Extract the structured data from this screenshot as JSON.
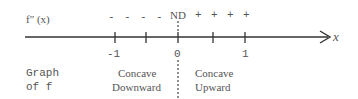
{
  "diagram": {
    "row_label_top": "f\" (x)",
    "signs_left": [
      "-",
      "-",
      "-",
      "-"
    ],
    "nd_label": "ND",
    "signs_right": [
      "+",
      "+",
      "+",
      "+"
    ],
    "axis_label": "x",
    "ticks": [
      {
        "x": 115,
        "label": "-1"
      },
      {
        "x": 146,
        "label": ""
      },
      {
        "x": 178,
        "label": "0"
      },
      {
        "x": 213,
        "label": ""
      },
      {
        "x": 245,
        "label": "1"
      }
    ],
    "row_label_bottom_line1": "Graph",
    "row_label_bottom_line2": "of f",
    "left_region_line1": "Concave",
    "left_region_line2": "Downward",
    "right_region_line1": "Concave",
    "right_region_line2": "Upward",
    "colors": {
      "ink": "#555555",
      "axis": "#333333"
    }
  }
}
